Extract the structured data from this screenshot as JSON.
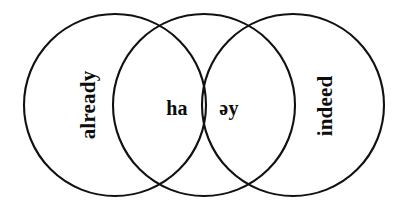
{
  "figure": {
    "type": "venn-diagram",
    "background_color": "#ffffff",
    "stroke_color": "#111111",
    "text_color": "#0d0d0d"
  },
  "chart_data": {
    "type": "venn",
    "title": "",
    "subtitle": "",
    "xlabel": "",
    "ylabel": "",
    "legend": [],
    "grid": false,
    "sets": [
      {
        "id": "left",
        "label": "already",
        "center_x": 115,
        "center_y": 105,
        "radius": 91,
        "label_orientation": "vertical-bottom-to-top"
      },
      {
        "id": "middle",
        "label": "",
        "center_x": 204,
        "center_y": 105,
        "radius": 91,
        "label_orientation": "none"
      },
      {
        "id": "right",
        "label": "indeed",
        "center_x": 293,
        "center_y": 105,
        "radius": 91,
        "label_orientation": "vertical-bottom-to-top"
      }
    ],
    "intersection_labels": [
      {
        "id": "left-middle",
        "text": "ha",
        "center_x": 177,
        "center_y": 108,
        "orientation": "horizontal"
      },
      {
        "id": "middle-right",
        "text": "əy",
        "center_x": 229,
        "center_y": 108,
        "orientation": "horizontal"
      }
    ]
  },
  "labels": {
    "left_circle": "already",
    "right_circle": "indeed",
    "left_lens": "ha",
    "right_lens": "əy"
  }
}
